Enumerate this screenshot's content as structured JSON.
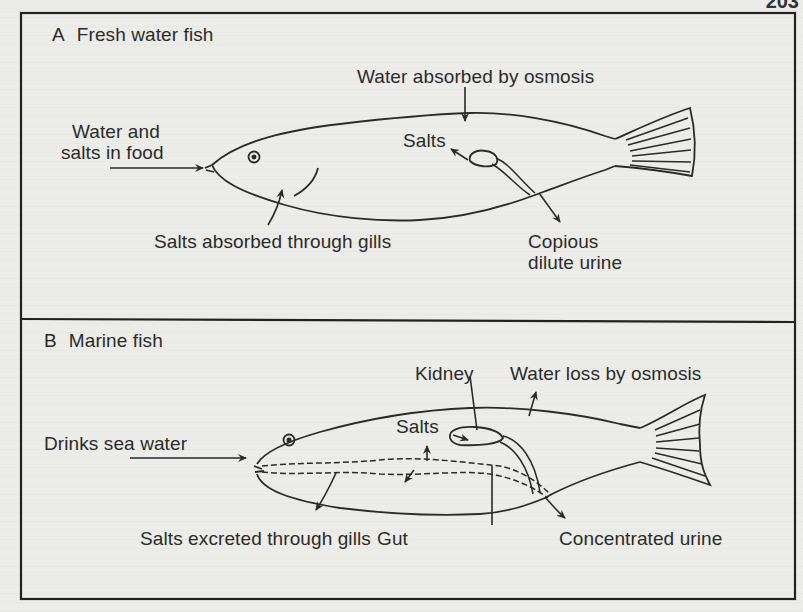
{
  "page": {
    "page_number_fragment": "203"
  },
  "panels": [
    {
      "letter": "A",
      "title": "Fresh water fish",
      "labels": {
        "water_in_food_line1": "Water and",
        "water_in_food_line2": "salts in food",
        "water_absorbed": "Water absorbed by osmosis",
        "salts": "Salts",
        "salts_absorbed_gills": "Salts absorbed through gills",
        "urine_line1": "Copious",
        "urine_line2": "dilute urine"
      }
    },
    {
      "letter": "B",
      "title": "Marine fish",
      "labels": {
        "kidney": "Kidney",
        "water_loss": "Water loss by osmosis",
        "drinks_sea_water": "Drinks sea water",
        "salts": "Salts",
        "salts_excreted_gills": "Salts excreted through gills",
        "gut": "Gut",
        "urine": "Concentrated urine"
      }
    }
  ],
  "colors": {
    "ink": "#2a2a2a",
    "paper": "#ecece8"
  }
}
